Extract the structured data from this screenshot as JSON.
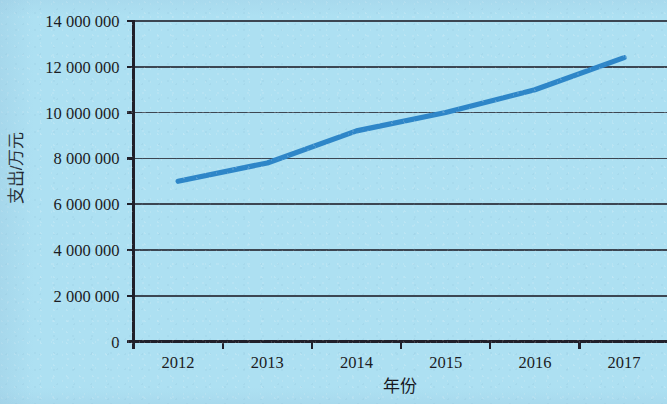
{
  "chart_data": {
    "type": "line",
    "title": "",
    "xlabel": "年份",
    "ylabel": "支出/万元",
    "x": [
      2012,
      2013,
      2014,
      2015,
      2016,
      2017
    ],
    "xticklabels": [
      "2012",
      "2013",
      "2014",
      "2015",
      "2016",
      "2017"
    ],
    "values": [
      7000000,
      7800000,
      9200000,
      10000000,
      11000000,
      12400000
    ],
    "series": [
      {
        "name": "支出",
        "values": [
          7000000,
          7800000,
          9200000,
          10000000,
          11000000,
          12400000
        ]
      }
    ],
    "ylim": [
      0,
      14000000
    ],
    "yticks": [
      0,
      2000000,
      4000000,
      6000000,
      8000000,
      10000000,
      12000000,
      14000000
    ],
    "yticklabels": [
      "0",
      "2 000 000",
      "4 000 000",
      "6 000 000",
      "8 000 000",
      "10 000 000",
      "12 000 000",
      "14 000 000"
    ],
    "grid": "horizontal",
    "legend": "none",
    "colors": {
      "background": "#ade0f2",
      "line": "#2e86c8",
      "axis": "#20202a",
      "grid": "#3c4652",
      "text": "#1b1b22"
    }
  }
}
